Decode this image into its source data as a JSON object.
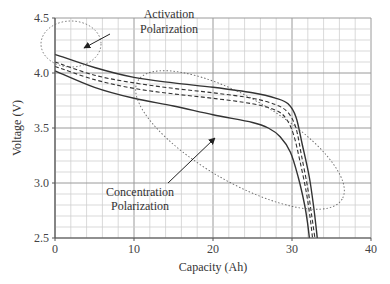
{
  "chart_data": {
    "type": "line",
    "title": "",
    "xlabel": "Capacity (Ah)",
    "ylabel": "Voltage (V)",
    "xlim": [
      0,
      40
    ],
    "ylim": [
      2.5,
      4.5
    ],
    "xticks": [
      "0",
      "10",
      "20",
      "30",
      "40"
    ],
    "yticks": [
      "2.5",
      "3.0",
      "3.5",
      "4.0",
      "4.5"
    ],
    "grid": true,
    "legend": null,
    "series": [
      {
        "name": "upper-solid",
        "style": "solid",
        "x": [
          0,
          5,
          10,
          15,
          20,
          25,
          28,
          29.5,
          30.5,
          31.3,
          32.2,
          32.8,
          33.2
        ],
        "y": [
          4.17,
          4.05,
          3.96,
          3.91,
          3.87,
          3.82,
          3.77,
          3.72,
          3.6,
          3.35,
          3.05,
          2.75,
          2.5
        ]
      },
      {
        "name": "upper-dashed",
        "style": "dashed",
        "x": [
          0,
          5,
          10,
          15,
          20,
          25,
          28,
          29.5,
          30.5,
          31.2,
          32.0,
          32.5,
          32.9
        ],
        "y": [
          4.1,
          3.98,
          3.91,
          3.86,
          3.82,
          3.77,
          3.71,
          3.64,
          3.5,
          3.25,
          2.95,
          2.7,
          2.5
        ]
      },
      {
        "name": "lower-dashed",
        "style": "dashed",
        "x": [
          0,
          5,
          10,
          15,
          20,
          25,
          28,
          29.3,
          30.2,
          31.0,
          31.8,
          32.3,
          32.6
        ],
        "y": [
          4.06,
          3.94,
          3.86,
          3.81,
          3.77,
          3.72,
          3.66,
          3.58,
          3.44,
          3.2,
          2.92,
          2.68,
          2.5
        ]
      },
      {
        "name": "lower-solid",
        "style": "solid",
        "x": [
          0,
          5,
          10,
          15,
          20,
          25,
          27,
          28.5,
          29.8,
          30.8,
          31.6,
          32.0,
          32.2
        ],
        "y": [
          4.02,
          3.87,
          3.77,
          3.7,
          3.62,
          3.55,
          3.5,
          3.42,
          3.28,
          3.05,
          2.8,
          2.62,
          2.5
        ]
      }
    ],
    "annotations": [
      {
        "text": [
          "Activation",
          "Polarization"
        ],
        "x": 14.5,
        "y": 4.36,
        "arrow_to": [
          3.5,
          4.19
        ],
        "ellipse": {
          "cx": 1.5,
          "cy": 4.1,
          "rx": 4.5,
          "ry": 0.17
        }
      },
      {
        "text": [
          "Concentration",
          "Polarization"
        ],
        "x": 14,
        "y": 2.87,
        "arrow_to": [
          20.5,
          3.65
        ],
        "ellipse": {
          "cx": 24.5,
          "cy": 3.5,
          "rx": 14.5,
          "ry": 0.35,
          "rotation_deg": 28
        }
      }
    ]
  },
  "labels": {
    "xlabel": "Capacity (Ah)",
    "ylabel": "Voltage (V)",
    "annot1_line1": "Activation",
    "annot1_line2": "Polarization",
    "annot2_line1": "Concentration",
    "annot2_line2": "Polarization"
  }
}
